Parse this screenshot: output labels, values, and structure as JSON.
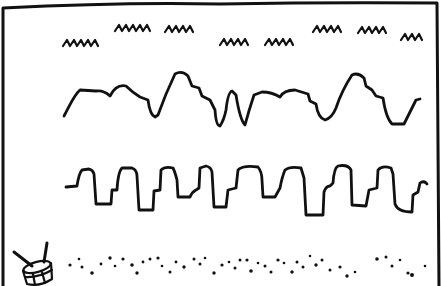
{
  "illustration": {
    "description": "Hand-drawn sketch of three sound waveforms above a drum with scattered dots",
    "ink_color": "#111111",
    "background_color": "#ffffff",
    "rows": [
      {
        "name": "squiggle-row",
        "kind": "small zigzag groups",
        "count": 8
      },
      {
        "name": "smooth-wave-row",
        "kind": "irregular rounded waveform"
      },
      {
        "name": "square-wave-row",
        "kind": "stepped square waveform"
      },
      {
        "name": "dot-row",
        "kind": "scattered dots"
      }
    ],
    "icon": "drum-icon"
  }
}
